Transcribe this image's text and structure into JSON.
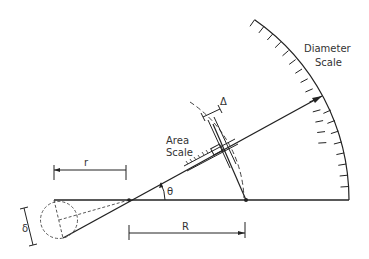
{
  "figure": {
    "labels": {
      "diameter_scale_line1": "Diameter",
      "diameter_scale_line2": "Scale",
      "area_scale_line1": "Area",
      "area_scale_line2": "Scale",
      "delta_upper": "Δ",
      "delta_lower": "δ",
      "theta": "θ",
      "r": "r",
      "R": "R"
    },
    "colors": {
      "ink": "#222222",
      "background": "#ffffff"
    }
  }
}
